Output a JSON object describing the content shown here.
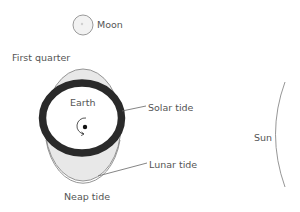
{
  "diagram": {
    "type": "neap-tide-illustration",
    "labels": {
      "moon": "Moon",
      "phase": "First quarter",
      "earth": "Earth",
      "solar_tide": "Solar tide",
      "lunar_tide": "Lunar tide",
      "tide_type": "Neap tide",
      "sun": "Sun"
    },
    "colors": {
      "ring": "#2a2a2a",
      "lunar_fill": "#e6e6e6",
      "outline": "#8a8a8a",
      "text": "#555555",
      "leader": "#666666"
    }
  }
}
